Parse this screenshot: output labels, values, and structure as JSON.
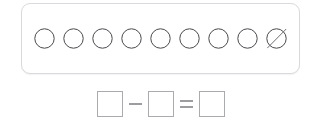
{
  "worksheet": {
    "title": "Subtraction counters worksheet",
    "panel": {
      "name": "counters-panel",
      "total_counters": 9,
      "crossed_out_count": 1,
      "remaining_count": 8,
      "border_color": "#d8dadd",
      "counters": [
        {
          "index": 1,
          "shape": "circle",
          "crossed_out": false,
          "icon": "circle-counter-icon"
        },
        {
          "index": 2,
          "shape": "circle",
          "crossed_out": false,
          "icon": "circle-counter-icon"
        },
        {
          "index": 3,
          "shape": "circle",
          "crossed_out": false,
          "icon": "circle-counter-icon"
        },
        {
          "index": 4,
          "shape": "circle",
          "crossed_out": false,
          "icon": "circle-counter-icon"
        },
        {
          "index": 5,
          "shape": "circle",
          "crossed_out": false,
          "icon": "circle-counter-icon"
        },
        {
          "index": 6,
          "shape": "circle",
          "crossed_out": false,
          "icon": "circle-counter-icon"
        },
        {
          "index": 7,
          "shape": "circle",
          "crossed_out": false,
          "icon": "circle-counter-icon"
        },
        {
          "index": 8,
          "shape": "circle",
          "crossed_out": false,
          "icon": "circle-counter-icon"
        },
        {
          "index": 9,
          "shape": "circle",
          "crossed_out": true,
          "icon": "circle-counter-crossed-icon"
        }
      ],
      "counter_stroke_color": "#4a4a4f",
      "slash_stroke_color": "#6f6f75"
    },
    "equation": {
      "name": "subtraction-equation",
      "minuend_value": "",
      "minuend_placeholder": "",
      "subtrahend_value": "",
      "subtrahend_placeholder": "",
      "result_value": "",
      "result_placeholder": "",
      "minus_symbol": "−",
      "equals_symbol": "=",
      "box_border_color": "#a9abae",
      "operator_color": "#9b9da0"
    }
  }
}
